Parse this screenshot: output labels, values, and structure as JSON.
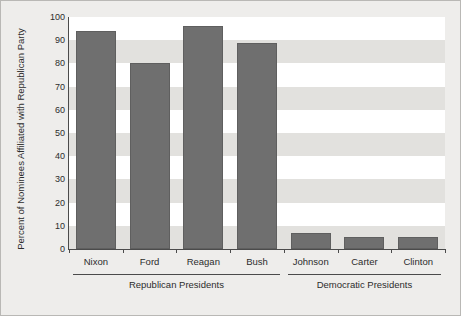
{
  "chart_data": {
    "type": "bar",
    "title": "",
    "subtitle": "",
    "xlabel": "",
    "ylabel": "Percent of Nominees Affiliated with Republican Party",
    "categories": [
      "Nixon",
      "Ford",
      "Reagan",
      "Bush",
      "Johnson",
      "Carter",
      "Clinton"
    ],
    "values": [
      94,
      80,
      96,
      89,
      7,
      5,
      5
    ],
    "ylim": [
      0,
      100
    ],
    "ytick_labels": [
      "0",
      "10",
      "20",
      "30",
      "40",
      "50",
      "60",
      "70",
      "80",
      "90",
      "100"
    ],
    "ytick_values": [
      0,
      10,
      20,
      30,
      40,
      50,
      60,
      70,
      80,
      90,
      100
    ],
    "grid": "alternating-horizontal-bands",
    "legend": "none",
    "series": [
      {
        "name": "Percent of Nominees Affiliated with Republican Party",
        "values": [
          94,
          80,
          96,
          89,
          7,
          5,
          5
        ],
        "color": "#6f6f6f"
      }
    ],
    "groups": [
      {
        "label": "Republican Presidents",
        "members": [
          "Nixon",
          "Ford",
          "Reagan",
          "Bush"
        ]
      },
      {
        "label": "Democratic Presidents",
        "members": [
          "Johnson",
          "Carter",
          "Clinton"
        ]
      }
    ],
    "colors": {
      "bar": "#6f6f6f",
      "bar_border": "#5f5f5f",
      "figure_background": "#eeedeb",
      "band_light": "#ffffff",
      "band_dark": "#e2e1de",
      "axis": "#4b4b4b",
      "text": "#2c2c2c",
      "figure_border": "#b9b8b5"
    }
  }
}
